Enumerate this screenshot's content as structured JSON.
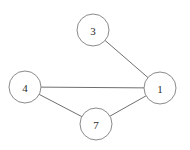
{
  "figure": {
    "kind": "undirected-graph-diagram",
    "width": 190,
    "height": 150,
    "background_color": "#ffffff"
  },
  "style": {
    "node_stroke_color": "#8a8a8a",
    "node_fill_color": "#ffffff",
    "node_stroke_width": 1,
    "node_radius": 16,
    "edge_color": "#6f6f6f",
    "edge_width": 1,
    "label_color": "#2b2b2b",
    "label_font_size": 11
  },
  "graph": {
    "nodes": [
      {
        "id": "3",
        "label": "3",
        "cx": 93,
        "cy": 30,
        "r": 16
      },
      {
        "id": "4",
        "label": "4",
        "cx": 25,
        "cy": 87,
        "r": 16
      },
      {
        "id": "1",
        "label": "1",
        "cx": 160,
        "cy": 88,
        "r": 16
      },
      {
        "id": "7",
        "label": "7",
        "cx": 96,
        "cy": 124,
        "r": 16
      }
    ],
    "edges": [
      {
        "id": "edge-3-1",
        "source": "3",
        "target": "1"
      },
      {
        "id": "edge-4-1",
        "source": "4",
        "target": "1"
      },
      {
        "id": "edge-4-7",
        "source": "4",
        "target": "7"
      },
      {
        "id": "edge-7-1",
        "source": "7",
        "target": "1"
      }
    ]
  }
}
